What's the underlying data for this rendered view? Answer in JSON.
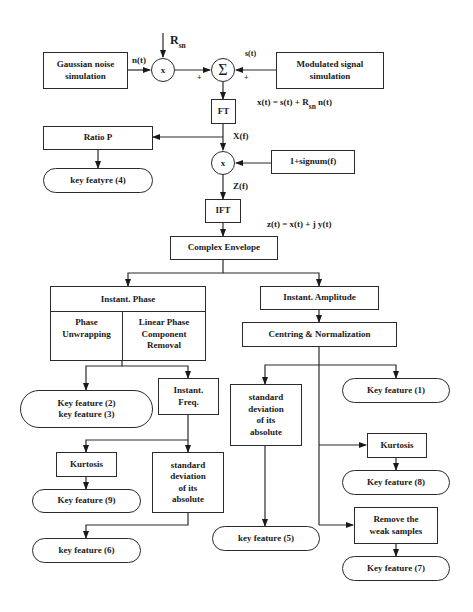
{
  "diagram": {
    "inputs": {
      "gaussian_noise": "Gaussian noise\nsimulation",
      "modulated_signal": "Modulated signal\nsimulation"
    },
    "signals": {
      "noise": "n(t)",
      "signal": "s(t)",
      "gain_main": "R",
      "gain_sub": "sn",
      "plus_left": "+",
      "plus_right": "+",
      "xf": "X(f)",
      "zf": "Z(f)"
    },
    "operators": {
      "multiply_noise": "x",
      "sum": "Σ",
      "multiply_spectrum": "x"
    },
    "equations": {
      "xt_prefix": "x(t)  =  s(t)  +  R",
      "xt_sub": "sn",
      "xt_suffix": "n(t)",
      "zt": "z(t) = x(t)  +  j   y(t)"
    },
    "blocks": {
      "ft": "FT",
      "ratio_p": "Ratio P",
      "signum": "1+signum(f)",
      "ifft": "IFT",
      "complex_envelope": "Complex Envelope",
      "instant_phase": "Instant. Phase",
      "phase_unwrapping": "Phase\nUnwrapping",
      "linear_phase_removal": "Linear Phase\nComponent\nRemoval",
      "instant_freq": "Instant.\nFreq.",
      "kurtosis_freq": "Kurtosis",
      "std_abs_freq": "standard\ndeviation\nof its\nabsolute",
      "instant_amplitude": "Instant. Amplitude",
      "centring_normalization": "Centring & Normalization",
      "std_abs_amp": "standard\ndeviation\nof its\nabsolute",
      "kurtosis_amp": "Kurtosis",
      "remove_weak": "Remove the\nweak samples"
    },
    "features": {
      "f4": "key featyre (4)",
      "f2_f3": "Key feature (2)\nkey feature (3)",
      "f9": "Key feature (9)",
      "f6": "key feature (6)",
      "f1": "Key feature (1)",
      "f8": "Key feature (8)",
      "f5": "key feature (5)",
      "f7": "Key feature (7)"
    }
  }
}
